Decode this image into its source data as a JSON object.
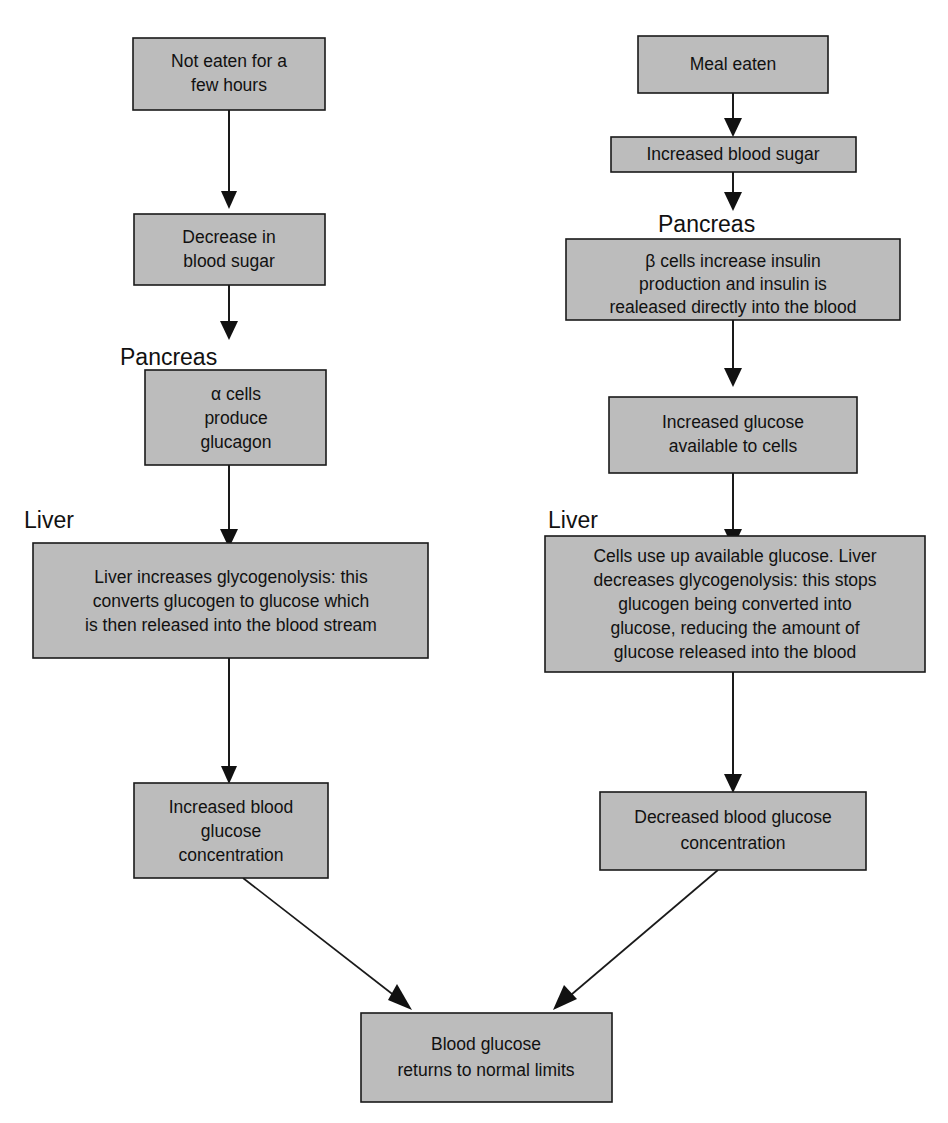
{
  "diagram": {
    "colors": {
      "box_fill": "#bcbcbc",
      "box_stroke": "#1a1a1a",
      "text": "#111111",
      "background": "#ffffff"
    },
    "group_labels": {
      "left_pancreas": "Pancreas",
      "left_liver": "Liver",
      "right_pancreas": "Pancreas",
      "right_liver": "Liver"
    },
    "left_branch": {
      "name": "low-blood-sugar-branch",
      "nodes": [
        {
          "id": "not-eaten",
          "lines": [
            "Not eaten for a",
            "few hours"
          ]
        },
        {
          "id": "decrease-blood-sugar",
          "lines": [
            "Decrease in",
            "blood sugar"
          ]
        },
        {
          "id": "alpha-cells",
          "lines": [
            "α cells",
            "produce",
            "glucagon"
          ]
        },
        {
          "id": "liver-glycogenolysis-increase",
          "lines": [
            "Liver increases glycogenolysis: this",
            "converts glucogen to glucose which",
            "is then released into the blood stream"
          ]
        },
        {
          "id": "increased-blood-glucose",
          "lines": [
            "Increased blood",
            "glucose",
            "concentration"
          ]
        }
      ]
    },
    "right_branch": {
      "name": "high-blood-sugar-branch",
      "nodes": [
        {
          "id": "meal-eaten",
          "lines": [
            "Meal eaten"
          ]
        },
        {
          "id": "increased-blood-sugar",
          "lines": [
            "Increased blood sugar"
          ]
        },
        {
          "id": "beta-cells",
          "lines": [
            "β cells increase insulin",
            "production and insulin is",
            "realeased directly into the blood"
          ]
        },
        {
          "id": "increased-glucose-available",
          "lines": [
            "Increased glucose",
            "available to cells"
          ]
        },
        {
          "id": "liver-glycogenolysis-decrease",
          "lines": [
            "Cells use up available glucose.  Liver",
            "decreases glycogenolysis: this stops",
            "glucogen being converted into",
            "glucose, reducing the amount of",
            "glucose released into the blood"
          ]
        },
        {
          "id": "decreased-blood-glucose",
          "lines": [
            "Decreased blood glucose",
            "concentration"
          ]
        }
      ]
    },
    "outcome": {
      "id": "blood-glucose-normal",
      "lines": [
        "Blood glucose",
        "returns to normal limits"
      ]
    }
  }
}
